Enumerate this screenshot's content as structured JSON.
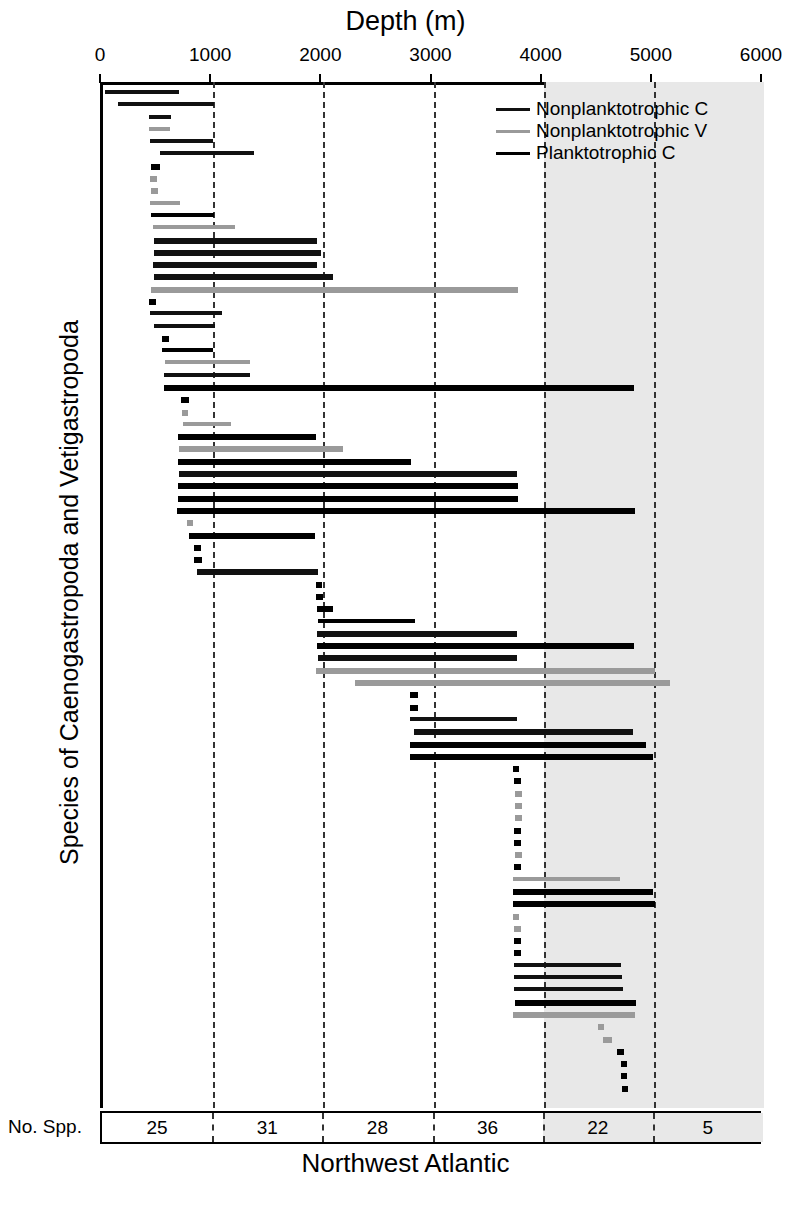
{
  "chart_data": {
    "type": "bar",
    "orientation": "horizontal-ranges",
    "title": "Northwest Atlantic",
    "xlabel": "Depth (m)",
    "ylabel": "Species of Caenogastropoda and Vetigastropoda",
    "xlim": [
      0,
      6000
    ],
    "xticks": [
      0,
      1000,
      2000,
      3000,
      4000,
      5000,
      6000
    ],
    "xticklabels": [
      "0",
      "1000",
      "2000",
      "3000",
      "4000",
      "5000",
      "6000"
    ],
    "grid": "vertical-dashed-at-1000-2000-3000-4000-5000",
    "shaded_region": [
      4000,
      6000
    ],
    "legend_position": "top-right",
    "legend": [
      {
        "name": "Nonplanktotrophic C",
        "color": "#111111"
      },
      {
        "name": "Nonplanktotrophic V",
        "color": "#9a9a9a"
      },
      {
        "name": "Planktotrophic C",
        "color": "#000000"
      }
    ],
    "series_colors": {
      "nonplanktotrophic_c": "#111111",
      "nonplanktotrophic_v": "#9a9a9a",
      "planktotrophic_c": "#000000"
    },
    "bars": [
      {
        "start": 20,
        "end": 690,
        "series": "nonplanktotrophic_c"
      },
      {
        "start": 140,
        "end": 1010,
        "series": "nonplanktotrophic_c"
      },
      {
        "start": 420,
        "end": 620,
        "series": "nonplanktotrophic_c"
      },
      {
        "start": 420,
        "end": 610,
        "series": "nonplanktotrophic_v"
      },
      {
        "start": 430,
        "end": 1000,
        "series": "nonplanktotrophic_c"
      },
      {
        "start": 520,
        "end": 1370,
        "series": "nonplanktotrophic_c"
      },
      {
        "start": 440,
        "end": 520,
        "series": "planktotrophic_c"
      },
      {
        "start": 430,
        "end": 490,
        "series": "nonplanktotrophic_v"
      },
      {
        "start": 440,
        "end": 500,
        "series": "nonplanktotrophic_v"
      },
      {
        "start": 430,
        "end": 700,
        "series": "nonplanktotrophic_v"
      },
      {
        "start": 440,
        "end": 1010,
        "series": "planktotrophic_c"
      },
      {
        "start": 450,
        "end": 1200,
        "series": "nonplanktotrophic_v"
      },
      {
        "start": 460,
        "end": 1940,
        "series": "nonplanktotrophic_c"
      },
      {
        "start": 460,
        "end": 1980,
        "series": "nonplanktotrophic_c"
      },
      {
        "start": 450,
        "end": 1940,
        "series": "nonplanktotrophic_c"
      },
      {
        "start": 460,
        "end": 2090,
        "series": "nonplanktotrophic_c"
      },
      {
        "start": 440,
        "end": 3770,
        "series": "nonplanktotrophic_v"
      },
      {
        "start": 420,
        "end": 480,
        "series": "planktotrophic_c"
      },
      {
        "start": 430,
        "end": 1080,
        "series": "nonplanktotrophic_c"
      },
      {
        "start": 460,
        "end": 1020,
        "series": "nonplanktotrophic_c"
      },
      {
        "start": 540,
        "end": 600,
        "series": "planktotrophic_c"
      },
      {
        "start": 540,
        "end": 1000,
        "series": "planktotrophic_c"
      },
      {
        "start": 560,
        "end": 1330,
        "series": "nonplanktotrophic_v"
      },
      {
        "start": 550,
        "end": 1330,
        "series": "nonplanktotrophic_c"
      },
      {
        "start": 550,
        "end": 4820,
        "series": "planktotrophic_c"
      },
      {
        "start": 710,
        "end": 780,
        "series": "planktotrophic_c"
      },
      {
        "start": 720,
        "end": 770,
        "series": "nonplanktotrophic_v"
      },
      {
        "start": 730,
        "end": 1160,
        "series": "nonplanktotrophic_v"
      },
      {
        "start": 680,
        "end": 1930,
        "series": "planktotrophic_c"
      },
      {
        "start": 690,
        "end": 2180,
        "series": "nonplanktotrophic_v"
      },
      {
        "start": 680,
        "end": 2800,
        "series": "planktotrophic_c"
      },
      {
        "start": 690,
        "end": 3760,
        "series": "nonplanktotrophic_c"
      },
      {
        "start": 680,
        "end": 3770,
        "series": "planktotrophic_c"
      },
      {
        "start": 680,
        "end": 3770,
        "series": "planktotrophic_c"
      },
      {
        "start": 670,
        "end": 4830,
        "series": "planktotrophic_c"
      },
      {
        "start": 760,
        "end": 820,
        "series": "nonplanktotrophic_v"
      },
      {
        "start": 780,
        "end": 1920,
        "series": "planktotrophic_c"
      },
      {
        "start": 830,
        "end": 890,
        "series": "planktotrophic_c"
      },
      {
        "start": 830,
        "end": 900,
        "series": "planktotrophic_c"
      },
      {
        "start": 850,
        "end": 1950,
        "series": "nonplanktotrophic_c"
      },
      {
        "start": 1930,
        "end": 1990,
        "series": "planktotrophic_c"
      },
      {
        "start": 1930,
        "end": 2000,
        "series": "planktotrophic_c"
      },
      {
        "start": 1940,
        "end": 2090,
        "series": "planktotrophic_c"
      },
      {
        "start": 1950,
        "end": 2830,
        "series": "planktotrophic_c"
      },
      {
        "start": 1940,
        "end": 3760,
        "series": "nonplanktotrophic_c"
      },
      {
        "start": 1940,
        "end": 4820,
        "series": "planktotrophic_c"
      },
      {
        "start": 1950,
        "end": 3760,
        "series": "nonplanktotrophic_c"
      },
      {
        "start": 1930,
        "end": 5010,
        "series": "nonplanktotrophic_v"
      },
      {
        "start": 2290,
        "end": 5150,
        "series": "nonplanktotrophic_v"
      },
      {
        "start": 2790,
        "end": 2860,
        "series": "planktotrophic_c"
      },
      {
        "start": 2790,
        "end": 2860,
        "series": "planktotrophic_c"
      },
      {
        "start": 2790,
        "end": 3760,
        "series": "nonplanktotrophic_c"
      },
      {
        "start": 2820,
        "end": 4810,
        "series": "nonplanktotrophic_c"
      },
      {
        "start": 2790,
        "end": 4930,
        "series": "planktotrophic_c"
      },
      {
        "start": 2790,
        "end": 4990,
        "series": "planktotrophic_c"
      },
      {
        "start": 3720,
        "end": 3780,
        "series": "planktotrophic_c"
      },
      {
        "start": 3730,
        "end": 3790,
        "series": "planktotrophic_c"
      },
      {
        "start": 3740,
        "end": 3800,
        "series": "nonplanktotrophic_v"
      },
      {
        "start": 3740,
        "end": 3800,
        "series": "nonplanktotrophic_v"
      },
      {
        "start": 3740,
        "end": 3800,
        "series": "nonplanktotrophic_v"
      },
      {
        "start": 3730,
        "end": 3790,
        "series": "planktotrophic_c"
      },
      {
        "start": 3730,
        "end": 3790,
        "series": "planktotrophic_c"
      },
      {
        "start": 3740,
        "end": 3800,
        "series": "nonplanktotrophic_v"
      },
      {
        "start": 3730,
        "end": 3790,
        "series": "planktotrophic_c"
      },
      {
        "start": 3720,
        "end": 4690,
        "series": "nonplanktotrophic_v"
      },
      {
        "start": 3720,
        "end": 4990,
        "series": "planktotrophic_c"
      },
      {
        "start": 3720,
        "end": 5010,
        "series": "planktotrophic_c"
      },
      {
        "start": 3720,
        "end": 3780,
        "series": "nonplanktotrophic_v"
      },
      {
        "start": 3730,
        "end": 3790,
        "series": "nonplanktotrophic_v"
      },
      {
        "start": 3730,
        "end": 3790,
        "series": "planktotrophic_c"
      },
      {
        "start": 3730,
        "end": 3790,
        "series": "planktotrophic_c"
      },
      {
        "start": 3730,
        "end": 4700,
        "series": "nonplanktotrophic_c"
      },
      {
        "start": 3730,
        "end": 4710,
        "series": "nonplanktotrophic_c"
      },
      {
        "start": 3730,
        "end": 4720,
        "series": "nonplanktotrophic_c"
      },
      {
        "start": 3740,
        "end": 4840,
        "series": "planktotrophic_c"
      },
      {
        "start": 3720,
        "end": 4830,
        "series": "nonplanktotrophic_v"
      },
      {
        "start": 4490,
        "end": 4550,
        "series": "nonplanktotrophic_v"
      },
      {
        "start": 4540,
        "end": 4620,
        "series": "nonplanktotrophic_v"
      },
      {
        "start": 4670,
        "end": 4730,
        "series": "planktotrophic_c"
      },
      {
        "start": 4700,
        "end": 4760,
        "series": "planktotrophic_c"
      },
      {
        "start": 4700,
        "end": 4760,
        "series": "planktotrophic_c"
      },
      {
        "start": 4710,
        "end": 4770,
        "series": "planktotrophic_c"
      }
    ],
    "species_counts_label": "No. Spp.",
    "species_counts_bins": [
      "0-1000",
      "1000-2000",
      "2000-3000",
      "3000-4000",
      "4000-5000",
      "5000-6000"
    ],
    "species_counts": [
      25,
      31,
      28,
      36,
      22,
      5
    ]
  }
}
